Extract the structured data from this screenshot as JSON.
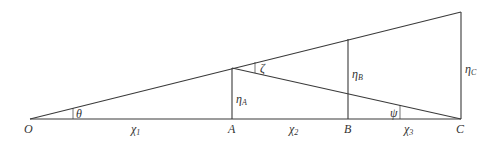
{
  "diagram": {
    "points": {
      "O": {
        "label": "O",
        "x": 30,
        "y": 119
      },
      "A": {
        "label": "A",
        "x": 232,
        "y": 119
      },
      "B": {
        "label": "B",
        "x": 348,
        "y": 119
      },
      "C": {
        "label": "C",
        "x": 461,
        "y": 119
      }
    },
    "heights": {
      "etaA": {
        "symbol": "η",
        "sub": "A",
        "top": 68
      },
      "etaB": {
        "symbol": "η",
        "sub": "B",
        "top": 39
      },
      "etaC": {
        "symbol": "η",
        "sub": "C",
        "top": 12
      }
    },
    "segments": {
      "chi1": {
        "symbol": "χ",
        "sub": "1"
      },
      "chi2": {
        "symbol": "χ",
        "sub": "2"
      },
      "chi3": {
        "symbol": "χ",
        "sub": "3"
      }
    },
    "angles": {
      "theta": "θ",
      "zeta": "ζ",
      "psi": "ψ"
    },
    "line_color": "#333333"
  }
}
